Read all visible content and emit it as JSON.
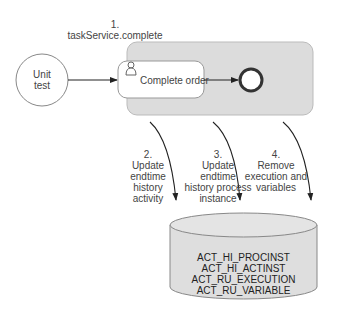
{
  "diagram": {
    "start_event": {
      "label_line1": "Unit",
      "label_line2": "test"
    },
    "step1": {
      "number": "1.",
      "label": "taskService.complete"
    },
    "user_task": {
      "label": "Complete order",
      "icon": "user-icon"
    },
    "end_event": {
      "icon": "end-event-circle"
    },
    "steps": [
      {
        "number": "2.",
        "lines": [
          "Update",
          "endtime",
          "history",
          "activity"
        ]
      },
      {
        "number": "3.",
        "lines": [
          "Update",
          "endtime",
          "history process",
          "instance"
        ]
      },
      {
        "number": "4.",
        "lines": [
          "Remove",
          "execution and",
          "variables"
        ]
      }
    ],
    "database": {
      "tables": [
        "ACT_HI_PROCINST",
        "ACT_HI_ACTINST",
        "ACT_RU_EXECUTION",
        "ACT_RU_VARIABLE"
      ]
    },
    "colors": {
      "pool_fill": "#dcdcdc",
      "db_fill": "#dedede",
      "stroke": "#555555"
    }
  }
}
